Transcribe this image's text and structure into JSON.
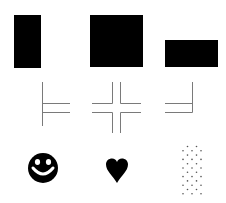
{
  "figure": {
    "colors": {
      "ink": "#000000",
      "line": "#7a7a7a",
      "background": "#ffffff",
      "dot": "#555555"
    },
    "rows": [
      {
        "name": "filled-rectangles",
        "items": [
          {
            "name": "tall-rectangle",
            "x": 14,
            "y": 15,
            "w": 27,
            "h": 53
          },
          {
            "name": "square",
            "x": 90,
            "y": 15,
            "w": 53,
            "h": 52
          },
          {
            "name": "wide-rectangle",
            "x": 165,
            "y": 40,
            "w": 53,
            "h": 27
          }
        ]
      },
      {
        "name": "line-junctions",
        "items": [
          {
            "name": "t-junction-right"
          },
          {
            "name": "cross-junction"
          },
          {
            "name": "t-junction-left"
          }
        ]
      },
      {
        "name": "symbols",
        "items": [
          {
            "name": "smiley-face"
          },
          {
            "name": "heart"
          },
          {
            "name": "dot-pattern"
          }
        ]
      }
    ]
  }
}
